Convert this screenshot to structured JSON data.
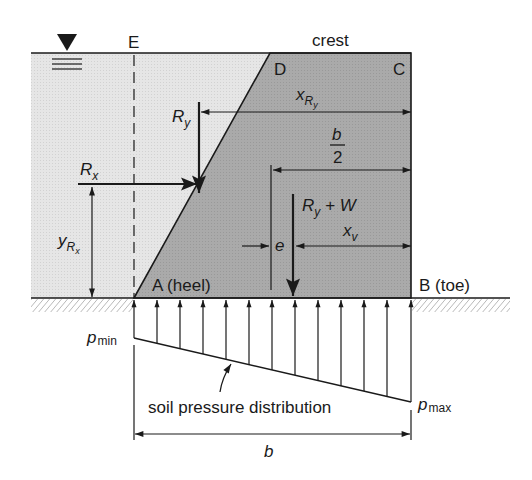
{
  "diagram": {
    "colors": {
      "water": "#e4e4e4",
      "dam": "#a9a9a9",
      "line": "#1a1a1a",
      "hatch": "#8a8a8a"
    },
    "labels": {
      "E": "E",
      "crest": "crest",
      "D": "D",
      "C": "C",
      "Ry": "R",
      "Ry_sub": "y",
      "xRy": "x",
      "xRy_sub": "R",
      "xRy_subsub": "y",
      "b_over_2_num": "b",
      "b_over_2_den": "2",
      "Rx": "R",
      "Rx_sub": "x",
      "yRx": "y",
      "yRx_sub": "R",
      "yRx_subsub": "x",
      "RyW_R": "R",
      "RyW_sub": "y",
      "RyW_rest": " + W",
      "e": "e",
      "xv": "x",
      "xv_sub": "v",
      "A_heel": "A (heel)",
      "B_toe": "B (toe)",
      "pmin": "p",
      "pmin_sub": "min",
      "pmax": "p",
      "pmax_sub": "max",
      "soil_pressure": "soil pressure distribution",
      "b": "b"
    },
    "icons": {
      "water_level": "water-surface-triangle-icon"
    }
  }
}
